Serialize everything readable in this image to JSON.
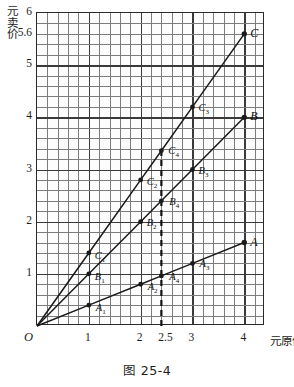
{
  "figure": {
    "caption": "图 25-4"
  },
  "axes": {
    "x_unit_label": "元原价",
    "y_unit_label_chars": [
      "元",
      "卖",
      "价"
    ],
    "origin_label": "O",
    "x_ticks": [
      {
        "value": 1,
        "label": "1"
      },
      {
        "value": 2,
        "label": "2"
      },
      {
        "value": 2.5,
        "label": "2.5"
      },
      {
        "value": 3,
        "label": "3"
      },
      {
        "value": 4,
        "label": "4"
      }
    ],
    "y_ticks": [
      {
        "value": 1,
        "label": "1"
      },
      {
        "value": 2,
        "label": "2"
      },
      {
        "value": 3,
        "label": "3"
      },
      {
        "value": 4,
        "label": "4"
      },
      {
        "value": 5,
        "label": "5"
      },
      {
        "value": 5.6,
        "label": "5.6"
      },
      {
        "value": 6,
        "label": "6"
      }
    ]
  },
  "chart_data": {
    "type": "line",
    "title": "图 25-4",
    "xlabel": "元原价",
    "ylabel": "元卖价",
    "xlim": [
      0,
      4.4
    ],
    "ylim": [
      0,
      6
    ],
    "grid": true,
    "grid_minor_step_x": 0.2,
    "grid_minor_step_y": 0.2,
    "grid_major_step_x": 1,
    "grid_major_step_y": 1,
    "legend": "none",
    "line_color": "#1a1a1a",
    "marker_color": "#1a1a1a",
    "annotation_line": {
      "type": "vertical-dashed",
      "x": 2.4,
      "y_from": 0,
      "y_to": 3.36,
      "color": "#111111"
    },
    "series": [
      {
        "name": "A",
        "slope": 0.4,
        "x": [
          0,
          1,
          2,
          2.4,
          3,
          4
        ],
        "y": [
          0,
          0.4,
          0.8,
          0.96,
          1.2,
          1.6
        ],
        "points": [
          {
            "label": "A",
            "sub": "1",
            "x": 1,
            "y": 0.4,
            "lx": 8,
            "ly": 5
          },
          {
            "label": "A",
            "sub": "2",
            "x": 2,
            "y": 0.8,
            "lx": 8,
            "ly": 5
          },
          {
            "label": "A",
            "sub": "4",
            "x": 2.4,
            "y": 0.96,
            "lx": 9,
            "ly": 3
          },
          {
            "label": "A",
            "sub": "3",
            "x": 3,
            "y": 1.2,
            "lx": 8,
            "ly": 3
          },
          {
            "label": "A",
            "sub": "",
            "x": 4,
            "y": 1.6,
            "lx": 7,
            "ly": 0
          }
        ]
      },
      {
        "name": "B",
        "slope": 1.0,
        "x": [
          0,
          1,
          2,
          2.4,
          3,
          4
        ],
        "y": [
          0,
          1,
          2,
          2.4,
          3,
          4
        ],
        "points": [
          {
            "label": "B",
            "sub": "1",
            "x": 1,
            "y": 1,
            "lx": 7,
            "ly": 5
          },
          {
            "label": "B",
            "sub": "2",
            "x": 2,
            "y": 2,
            "lx": 7,
            "ly": 3
          },
          {
            "label": "B",
            "sub": "4",
            "x": 2.4,
            "y": 2.4,
            "lx": 9,
            "ly": 3
          },
          {
            "label": "B",
            "sub": "3",
            "x": 3,
            "y": 3,
            "lx": 7,
            "ly": 3
          },
          {
            "label": "B",
            "sub": "",
            "x": 4,
            "y": 4,
            "lx": 7,
            "ly": 0
          }
        ]
      },
      {
        "name": "C",
        "slope": 1.4,
        "x": [
          0,
          1,
          2,
          2.4,
          3,
          4
        ],
        "y": [
          0,
          1.4,
          2.8,
          3.36,
          4.2,
          5.6
        ],
        "points": [
          {
            "label": "C",
            "sub": "1",
            "x": 1,
            "y": 1.4,
            "lx": 7,
            "ly": 5
          },
          {
            "label": "C",
            "sub": "2",
            "x": 2,
            "y": 2.8,
            "lx": 7,
            "ly": 4
          },
          {
            "label": "C",
            "sub": "4",
            "x": 2.4,
            "y": 3.36,
            "lx": 8,
            "ly": 2
          },
          {
            "label": "C",
            "sub": "3",
            "x": 3,
            "y": 4.2,
            "lx": 7,
            "ly": 3
          },
          {
            "label": "C",
            "sub": "",
            "x": 4,
            "y": 5.6,
            "lx": 7,
            "ly": 0
          }
        ]
      }
    ]
  }
}
